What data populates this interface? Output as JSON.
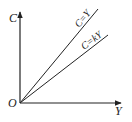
{
  "diagram": {
    "type": "consumption-income lines",
    "axes": {
      "vertical_label": "C",
      "horizontal_label": "Y",
      "origin_label": "O"
    },
    "lines": [
      {
        "name": "line-c-equals-y",
        "label": "C=Y"
      },
      {
        "name": "line-c-equals-ky",
        "label": "C=kY"
      }
    ],
    "colors": {
      "ink": "#222222",
      "background": "#ffffff"
    }
  }
}
